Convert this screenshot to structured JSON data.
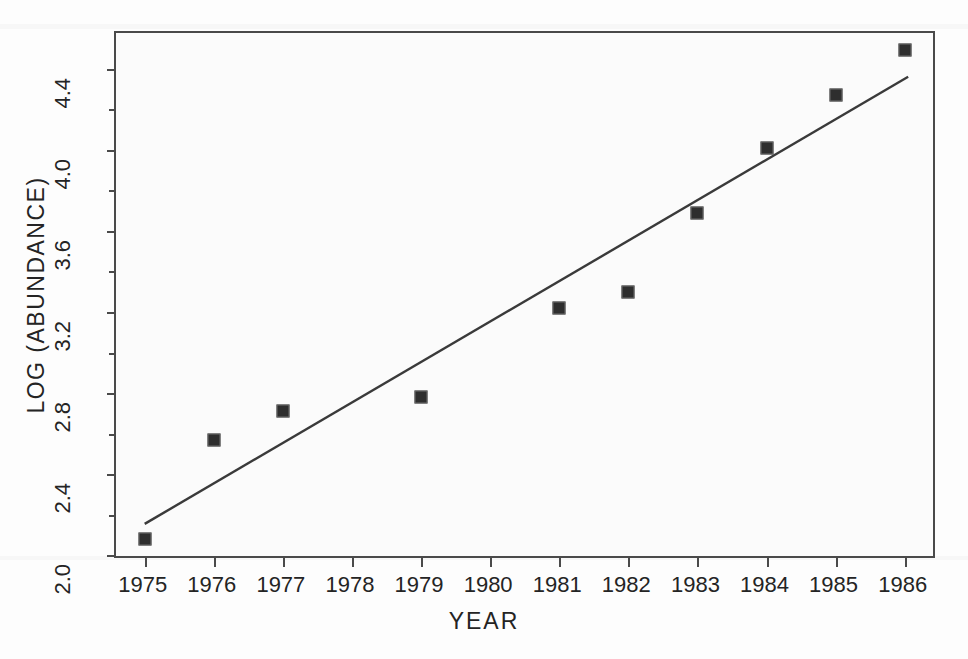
{
  "chart_data": {
    "type": "scatter",
    "title": "",
    "xlabel": "YEAR",
    "ylabel": "LOG (ABUNDANCE)",
    "xlim": [
      1974.6,
      1986.5
    ],
    "ylim": [
      2.0,
      4.5
    ],
    "grid": false,
    "legend": "none",
    "x_ticks": [
      1975,
      1976,
      1977,
      1978,
      1979,
      1980,
      1981,
      1982,
      1983,
      1984,
      1985,
      1986
    ],
    "x_tick_labels": [
      "1975",
      "1976",
      "1977",
      "1978",
      "1979",
      "1980",
      "1981",
      "1982",
      "1983",
      "1984",
      "1985",
      "1986"
    ],
    "y_ticks": [
      2.0,
      2.2,
      2.4,
      2.6,
      2.8,
      3.0,
      3.2,
      3.4,
      3.6,
      3.8,
      4.0,
      4.2,
      4.4
    ],
    "y_tick_labels": [
      "2.0",
      "",
      "2.4",
      "",
      "2.8",
      "",
      "3.2",
      "",
      "3.6",
      "",
      "4.0",
      "",
      "4.4"
    ],
    "y_major_ticks": [
      2.0,
      2.4,
      2.8,
      3.2,
      3.6,
      4.0,
      4.4
    ],
    "series": [
      {
        "name": "observations",
        "type": "scatter",
        "marker": "square",
        "marker_size": 13,
        "color": "#2e2e2e",
        "x": [
          1975,
          1976,
          1977,
          1979,
          1981,
          1982,
          1983,
          1984,
          1985,
          1986
        ],
        "y": [
          2.08,
          2.57,
          2.71,
          2.78,
          3.22,
          3.3,
          3.69,
          4.01,
          4.27,
          4.49
        ]
      },
      {
        "name": "regression-line",
        "type": "line",
        "color": "#3a3a3a",
        "x": [
          1975.0,
          1986.05
        ],
        "y": [
          2.155,
          4.36
        ]
      }
    ],
    "missing_years": [
      1978,
      1980
    ]
  },
  "axes": {
    "x_title": "YEAR",
    "y_title": "LOG (ABUNDANCE)"
  },
  "colors": {
    "marker": "#2e2e2e",
    "line": "#3a3a3a",
    "frame": "#4a4a4a",
    "text": "#242424",
    "plot_background": "#fbfbfb",
    "page_background": "#fdfdfd"
  }
}
